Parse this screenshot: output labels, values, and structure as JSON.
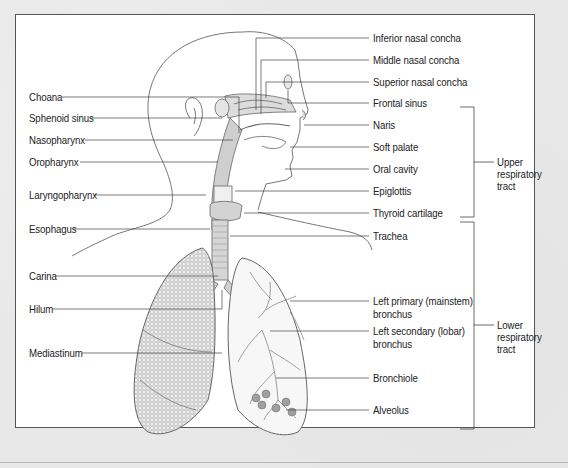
{
  "diagram": {
    "type": "anatomical-diagram",
    "left_labels": [
      {
        "id": "choana",
        "text": "Choana"
      },
      {
        "id": "sphenoid-sinus",
        "text": "Sphenoid sinus"
      },
      {
        "id": "nasopharynx",
        "text": "Nasopharynx"
      },
      {
        "id": "oropharynx",
        "text": "Oropharynx"
      },
      {
        "id": "laryngopharynx",
        "text": "Laryngopharynx"
      },
      {
        "id": "esophagus",
        "text": "Esophagus"
      },
      {
        "id": "carina",
        "text": "Carina"
      },
      {
        "id": "hilum",
        "text": "Hilum"
      },
      {
        "id": "mediastinum",
        "text": "Mediastinum"
      }
    ],
    "right_labels": [
      {
        "id": "inferior-nasal-concha",
        "text": "Inferior nasal concha"
      },
      {
        "id": "middle-nasal-concha",
        "text": "Middle nasal concha"
      },
      {
        "id": "superior-nasal-concha",
        "text": "Superior nasal concha"
      },
      {
        "id": "frontal-sinus",
        "text": "Frontal sinus"
      },
      {
        "id": "naris",
        "text": "Naris"
      },
      {
        "id": "soft-palate",
        "text": "Soft palate"
      },
      {
        "id": "oral-cavity",
        "text": "Oral cavity"
      },
      {
        "id": "epiglottis",
        "text": "Epiglottis"
      },
      {
        "id": "thyroid-cartilage",
        "text": "Thyroid cartilage"
      },
      {
        "id": "trachea",
        "text": "Trachea"
      },
      {
        "id": "left-primary-bronchus",
        "line1": "Left primary (mainstem)",
        "line2": "bronchus"
      },
      {
        "id": "left-secondary-bronchus",
        "line1": "Left secondary (lobar)",
        "line2": "bronchus"
      },
      {
        "id": "bronchiole",
        "text": "Bronchiole"
      },
      {
        "id": "alveolus",
        "text": "Alveolus"
      }
    ],
    "groups": [
      {
        "id": "upper-respiratory-tract",
        "line1": "Upper",
        "line2": "respiratory",
        "line3": "tract"
      },
      {
        "id": "lower-respiratory-tract",
        "line1": "Lower",
        "line2": "respiratory",
        "line3": "tract"
      }
    ]
  }
}
